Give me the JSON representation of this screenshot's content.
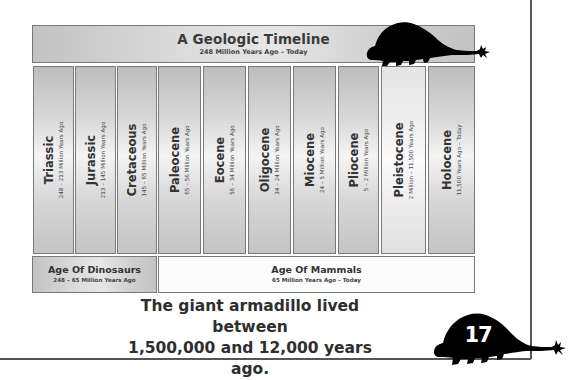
{
  "header": {
    "title": "A Geologic Timeline",
    "subtitle": "248 Million Years Ago – Today"
  },
  "periods": [
    {
      "name": "Triassic",
      "range": "248 – 213 Million Years Ago"
    },
    {
      "name": "Jurassic",
      "range": "213 – 145 Million Years Ago"
    },
    {
      "name": "Cretaceous",
      "range": "145 – 65 Million Years Ago"
    },
    {
      "name": "Paleocene",
      "range": "65 – 56 Million Years Ago"
    },
    {
      "name": "Eocene",
      "range": "56 – 34 Million Years Ago"
    },
    {
      "name": "Oligocene",
      "range": "34 – 24 Million Years Ago"
    },
    {
      "name": "Miocene",
      "range": "24 – 5 Million Years Ago"
    },
    {
      "name": "Pliocene",
      "range": "5 – 2 Million Years Ago"
    },
    {
      "name": "Pleistocene",
      "range": "2 Million – 11,500 Years Ago",
      "highlighted": true
    },
    {
      "name": "Holocene",
      "range": "11,500 Years Ago – Today"
    }
  ],
  "ages": {
    "dinosaurs": {
      "title": "Age Of Dinosaurs",
      "range": "248 – 65 Million Years Ago"
    },
    "mammals": {
      "title": "Age Of Mammals",
      "range": "65 Million Years Ago – Today"
    }
  },
  "caption": {
    "line1": "The giant armadillo lived between",
    "line2": "1,500,000 and 12,000 years ago."
  },
  "page_number": "17",
  "icons": {
    "top_silhouette": "armadillo-silhouette-icon",
    "bottom_silhouette": "armadillo-silhouette-icon"
  }
}
